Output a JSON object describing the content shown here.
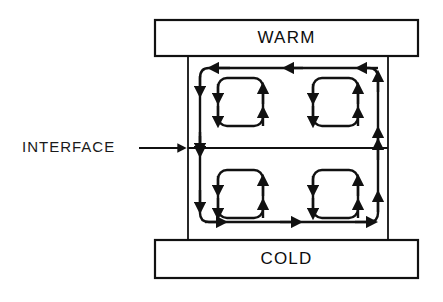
{
  "diagram": {
    "title_top_box": "WARM",
    "title_bottom_box": "COLD",
    "annotation_label": "INTERFACE",
    "colors": {
      "stroke": "#111111",
      "background": "#ffffff",
      "text": "#0d0d0d"
    },
    "structure": {
      "top_plate": {
        "label": "WARM",
        "x": 155,
        "y": 20,
        "width": 263,
        "height": 36
      },
      "bottom_plate": {
        "label": "COLD",
        "x": 155,
        "y": 240,
        "width": 263,
        "height": 38
      },
      "enclosure": {
        "x": 188,
        "y": 56,
        "width": 200,
        "height": 184
      },
      "interface_line_y": 148,
      "cells": [
        {
          "name": "top-left",
          "rotation": "counterclockwise",
          "x": 200,
          "y": 68,
          "width": 89,
          "height": 80
        },
        {
          "name": "top-right",
          "rotation": "clockwise",
          "x": 289,
          "y": 68,
          "width": 89,
          "height": 80
        },
        {
          "name": "bottom-left",
          "rotation": "clockwise",
          "x": 200,
          "y": 148,
          "width": 89,
          "height": 74
        },
        {
          "name": "bottom-right",
          "rotation": "counterclockwise",
          "x": 289,
          "y": 148,
          "width": 89,
          "height": 74
        }
      ],
      "inner_loops": [
        {
          "name": "top-left-inner",
          "x": 218,
          "y": 78,
          "width": 45,
          "height": 48,
          "rotation": "counterclockwise"
        },
        {
          "name": "top-right-inner",
          "x": 313,
          "y": 78,
          "width": 45,
          "height": 48,
          "rotation": "clockwise"
        },
        {
          "name": "bottom-left-inner",
          "x": 218,
          "y": 170,
          "width": 45,
          "height": 48,
          "rotation": "clockwise"
        },
        {
          "name": "bottom-right-inner",
          "x": 313,
          "y": 170,
          "width": 45,
          "height": 48,
          "rotation": "counterclockwise"
        }
      ]
    }
  }
}
